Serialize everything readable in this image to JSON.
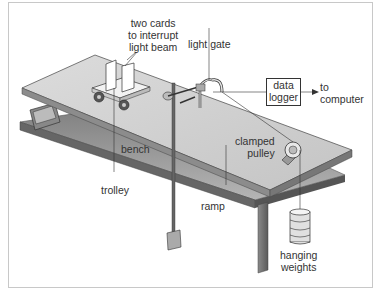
{
  "diagram": {
    "labels": {
      "cards": [
        "two cards",
        "to interrupt",
        "light beam"
      ],
      "light_gate": "light gate",
      "data_logger": [
        "data",
        "logger"
      ],
      "to_computer": [
        "to",
        "computer"
      ],
      "bench": "bench",
      "trolley": "trolley",
      "clamped_pulley": [
        "clamped",
        "pulley"
      ],
      "ramp": "ramp",
      "hanging_weights": [
        "hanging",
        "weights"
      ]
    },
    "colors": {
      "ramp_top": "#d4d4d4",
      "ramp_edge": "#8a8a8a",
      "bench": "#9a9a9a",
      "line": "#333333",
      "border": "#c8c8c8"
    }
  }
}
